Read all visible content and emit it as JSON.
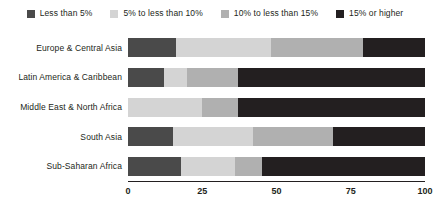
{
  "chart_data": {
    "type": "bar",
    "orientation": "horizontal",
    "stacked": true,
    "title": "",
    "xlabel": "",
    "ylabel": "",
    "xlim": [
      0,
      100
    ],
    "xticks": [
      "0",
      "25",
      "50",
      "75",
      "100"
    ],
    "xtick_values": [
      0,
      25,
      50,
      75,
      100
    ],
    "grid": false,
    "legend_position": "top",
    "categories": [
      "Europe & Central Asia",
      "Latin America & Caribbean",
      "Middle East & North Africa",
      "South Asia",
      "Sub-Saharan Africa"
    ],
    "series": [
      {
        "name": "Less than 5%",
        "color": "#4a4a4a",
        "values": [
          16,
          12,
          0,
          15,
          18
        ]
      },
      {
        "name": "5% to less than 10%",
        "color": "#d4d4d4",
        "values": [
          32,
          8,
          25,
          27,
          18
        ]
      },
      {
        "name": "10% to less than 15%",
        "color": "#b0b0b0",
        "values": [
          31,
          17,
          12,
          27,
          9
        ]
      },
      {
        "name": "15% or higher",
        "color": "#231f20",
        "values": [
          21,
          63,
          63,
          31,
          55
        ]
      }
    ]
  }
}
